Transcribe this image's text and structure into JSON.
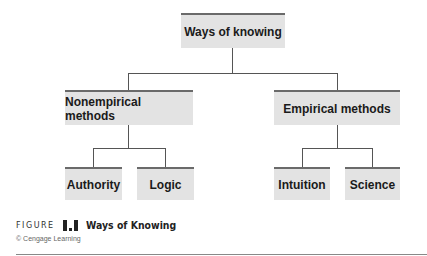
{
  "diagram": {
    "root": {
      "label": "Ways of knowing"
    },
    "branches": [
      {
        "label": "Nonempirical methods",
        "children": [
          {
            "label": "Authority"
          },
          {
            "label": "Logic"
          }
        ]
      },
      {
        "label": "Empirical methods",
        "children": [
          {
            "label": "Intuition"
          },
          {
            "label": "Science"
          }
        ]
      }
    ]
  },
  "caption": {
    "figure_word": "FIGURE",
    "figure_number": "1.1",
    "title": "Ways of Knowing",
    "credit": "© Cengage Learning"
  },
  "colors": {
    "box_fill": "#e3e3e3",
    "box_border": "#6a6a6a",
    "line": "#555555"
  }
}
